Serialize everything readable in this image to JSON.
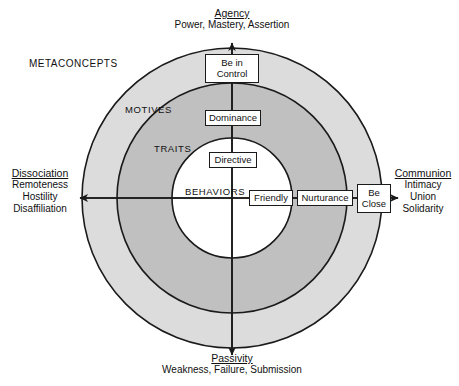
{
  "figure": {
    "metaconcepts_label": "METACONCEPTS",
    "rings": [
      {
        "id": "motives",
        "label": "MOTIVES",
        "fill": "#dcdcdc",
        "radius": 150
      },
      {
        "id": "traits",
        "label": "TRAITS",
        "fill": "#c0c0c0",
        "radius": 115
      },
      {
        "id": "behaviors",
        "label": "BEHAVIORS",
        "fill": "#ffffff",
        "radius": 60
      }
    ],
    "axes": {
      "top": {
        "title": "Agency",
        "subtitle": "Power, Mastery, Assertion"
      },
      "bottom": {
        "title": "Passivity",
        "subtitle": "Weakness, Failure, Submission"
      },
      "left": {
        "title": "Dissociation",
        "lines": [
          "Remoteness",
          "Hostility",
          "Disaffiliation"
        ]
      },
      "right": {
        "title": "Communion",
        "lines": [
          "Intimacy",
          "Union",
          "Solidarity"
        ]
      }
    },
    "nodes": {
      "vertical": [
        {
          "id": "be-in-control",
          "label": "Be in Control",
          "ring": "motives"
        },
        {
          "id": "dominance",
          "label": "Dominance",
          "ring": "traits"
        },
        {
          "id": "directive",
          "label": "Directive",
          "ring": "behaviors"
        }
      ],
      "horizontal": [
        {
          "id": "friendly",
          "label": "Friendly",
          "ring": "behaviors"
        },
        {
          "id": "nurturance",
          "label": "Nurturance",
          "ring": "traits"
        },
        {
          "id": "be-close",
          "label": "Be Close",
          "ring": "motives"
        }
      ]
    },
    "colors": {
      "stroke": "#1a1a1a",
      "outer_ring_fill": "#dcdcdc",
      "middle_ring_fill": "#c0c0c0",
      "inner_fill": "#ffffff",
      "background": "#ffffff"
    }
  }
}
